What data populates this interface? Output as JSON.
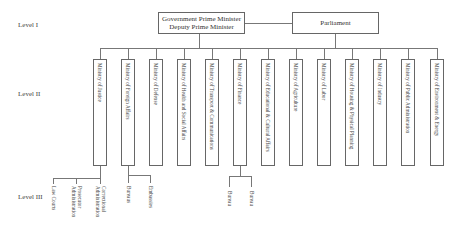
{
  "levels": {
    "level1": "Level I",
    "level2": "Level II",
    "level3": "Level III"
  },
  "level1": {
    "government": {
      "line1": "Government Prime Minister",
      "line2": "Deputy Prime Minister"
    },
    "parliament": "Parliament"
  },
  "ministries": [
    {
      "label": "Ministry of Justice"
    },
    {
      "label": "Ministry of Foreign Affairs"
    },
    {
      "label": "Ministry of Defense"
    },
    {
      "label": "Ministry of Health and Social Affairs"
    },
    {
      "label": "Ministry of Transport & Communications"
    },
    {
      "label": "Ministry of Finance"
    },
    {
      "label": "Ministry of Educational & Cultural Affairs"
    },
    {
      "label": "Ministry of Agriculture"
    },
    {
      "label": "Ministry of Labor"
    },
    {
      "label": "Ministry of Housing & Physical Planning"
    },
    {
      "label": "Ministry of Industry"
    },
    {
      "label": "Ministry of Public Administration"
    },
    {
      "label": "Ministry of Environment & Energy"
    }
  ],
  "level3": {
    "justice": [
      {
        "line1": "Law Courts"
      },
      {
        "line1": "Prosecutor",
        "line2": "Administration"
      },
      {
        "line1": "Correctional",
        "line2": "Administration"
      }
    ],
    "foreign_affairs": [
      {
        "line1": "Bureaus"
      },
      {
        "line1": "Embassies"
      }
    ],
    "finance": [
      {
        "line1": "Bureau"
      },
      {
        "line1": "Bureau"
      }
    ]
  }
}
